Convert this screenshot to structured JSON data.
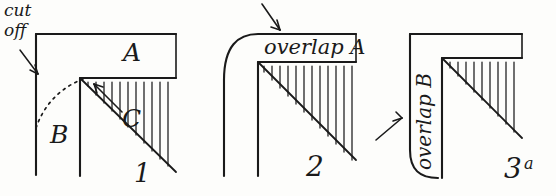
{
  "diagram": {
    "title_hidden": "",
    "figures": [
      {
        "id": "figure-1",
        "number": "1",
        "labels": {
          "cut": "cut",
          "off": "off",
          "a": "A",
          "b": "B",
          "c": "C"
        }
      },
      {
        "id": "figure-2",
        "number": "2",
        "labels": {
          "overlap_a": "overlap A"
        }
      },
      {
        "id": "figure-3",
        "number": "3",
        "number_sup": "a",
        "labels": {
          "overlap_b": "overlap B"
        }
      }
    ],
    "colors": {
      "ink": "#1a1a1a",
      "paper": "#fdfdfb"
    }
  }
}
